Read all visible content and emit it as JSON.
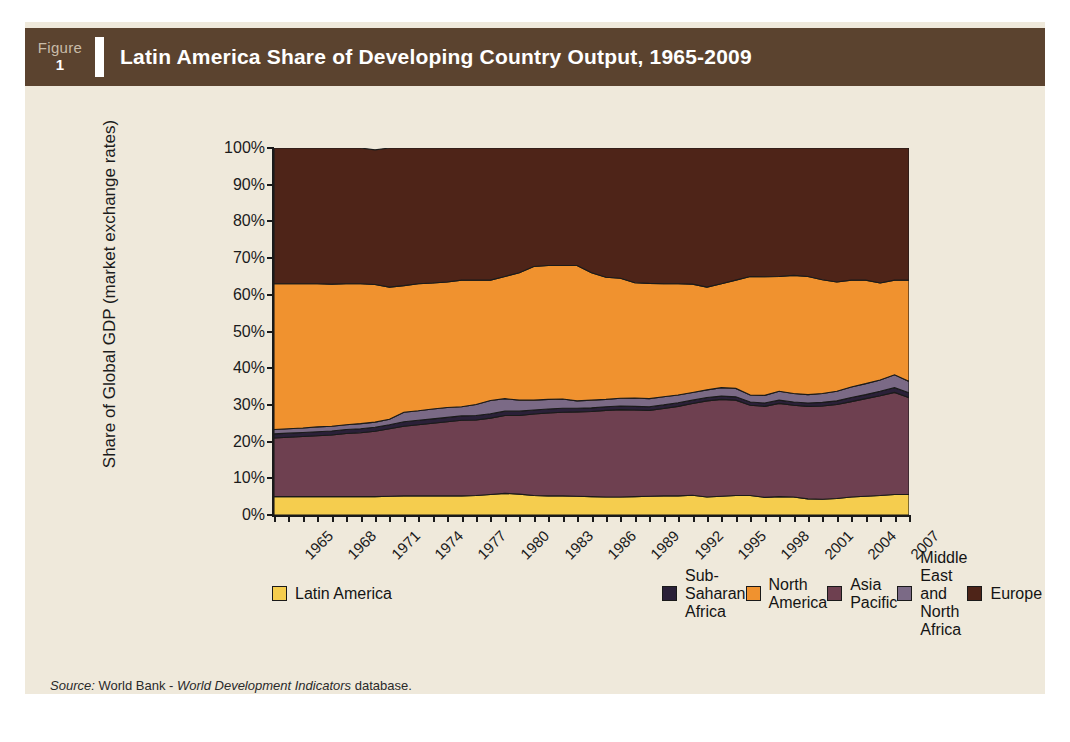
{
  "figure": {
    "word": "Figure",
    "number": "1"
  },
  "header": {
    "title": "Latin America Share of Developing Country Output, 1965-2009"
  },
  "source": {
    "prefix": "Source:",
    "body": "World Bank - ",
    "italic": "World Development Indicators",
    "suffix": " database."
  },
  "colors": {
    "page_background": "#efe9db",
    "title_bar": "#5b432f",
    "axis": "#1a1a1a",
    "latin_america": "#f5cd4e",
    "asia_pacific": "#6e4050",
    "sub_saharan_africa": "#2a2038",
    "middle_east_north_africa": "#7b6a86",
    "north_america": "#f0922f",
    "europe": "#4e2418"
  },
  "chart_data": {
    "type": "area",
    "stacked": true,
    "title": "Latin America Share of Developing Country Output, 1965-2009",
    "xlabel": "",
    "ylabel": "Share of Global GDP (market exchange rates)",
    "ylim": [
      0,
      100
    ],
    "yticks": [
      "0%",
      "10%",
      "20%",
      "30%",
      "40%",
      "50%",
      "60%",
      "70%",
      "80%",
      "90%",
      "100%"
    ],
    "ytick_values": [
      0,
      10,
      20,
      30,
      40,
      50,
      60,
      70,
      80,
      90,
      100
    ],
    "xlim": [
      1965,
      2009
    ],
    "xtick_labels": [
      "1965",
      "1968",
      "1971",
      "1974",
      "1977",
      "1980",
      "1983",
      "1986",
      "1989",
      "1992",
      "1995",
      "1998",
      "2001",
      "2004",
      "2007"
    ],
    "xtick_values": [
      1965,
      1968,
      1971,
      1974,
      1977,
      1980,
      1983,
      1986,
      1989,
      1992,
      1995,
      1998,
      2001,
      2004,
      2007
    ],
    "grid": false,
    "legend_position": "bottom",
    "x": [
      1965,
      1966,
      1967,
      1968,
      1969,
      1970,
      1971,
      1972,
      1973,
      1974,
      1975,
      1976,
      1977,
      1978,
      1979,
      1980,
      1981,
      1982,
      1983,
      1984,
      1985,
      1986,
      1987,
      1988,
      1989,
      1990,
      1991,
      1992,
      1993,
      1994,
      1995,
      1996,
      1997,
      1998,
      1999,
      2000,
      2001,
      2002,
      2003,
      2004,
      2005,
      2006,
      2007,
      2008,
      2009
    ],
    "series": [
      {
        "name": "Latin America",
        "color": "#f5cd4e",
        "values": [
          5.0,
          5.0,
          5.0,
          5.0,
          5.0,
          5.0,
          5.0,
          5.0,
          5.1,
          5.2,
          5.2,
          5.2,
          5.2,
          5.2,
          5.3,
          5.6,
          5.9,
          5.7,
          5.3,
          5.2,
          5.2,
          5.1,
          5.0,
          4.9,
          4.9,
          5.0,
          5.1,
          5.2,
          5.2,
          5.4,
          4.9,
          5.1,
          5.3,
          5.3,
          4.8,
          5.0,
          4.9,
          4.4,
          4.3,
          4.5,
          4.9,
          5.1,
          5.3,
          5.6,
          5.6
        ]
      },
      {
        "name": "Asia Pacific",
        "color": "#6e4050",
        "values": [
          16.0,
          16.2,
          16.4,
          16.6,
          16.8,
          17.2,
          17.4,
          17.8,
          18.4,
          19.0,
          19.4,
          19.8,
          20.2,
          20.6,
          20.6,
          20.8,
          21.2,
          21.4,
          22.2,
          22.6,
          22.8,
          23.0,
          23.2,
          23.6,
          23.8,
          23.6,
          23.4,
          23.8,
          24.4,
          25.0,
          26.2,
          26.4,
          26.0,
          24.6,
          24.8,
          25.4,
          25.0,
          25.2,
          25.4,
          25.6,
          26.0,
          26.6,
          27.2,
          27.8,
          26.4
        ]
      },
      {
        "name": "Sub-Saharan Africa",
        "color": "#2a2038",
        "values": [
          1.1,
          1.1,
          1.1,
          1.1,
          1.1,
          1.1,
          1.1,
          1.1,
          1.1,
          1.2,
          1.2,
          1.2,
          1.2,
          1.2,
          1.2,
          1.2,
          1.2,
          1.2,
          1.1,
          1.1,
          1.1,
          1.0,
          1.0,
          1.0,
          1.0,
          1.0,
          1.0,
          1.0,
          1.0,
          0.9,
          0.9,
          0.9,
          0.9,
          0.9,
          0.9,
          0.9,
          0.9,
          0.9,
          1.0,
          1.0,
          1.1,
          1.1,
          1.2,
          1.3,
          1.3
        ]
      },
      {
        "name": "Middle East and North Africa",
        "color": "#7b6a86",
        "values": [
          1.2,
          1.2,
          1.2,
          1.3,
          1.3,
          1.3,
          1.4,
          1.4,
          1.5,
          2.6,
          2.6,
          2.7,
          2.7,
          2.5,
          3.0,
          3.6,
          3.4,
          3.0,
          2.7,
          2.6,
          2.5,
          2.0,
          2.1,
          2.0,
          2.1,
          2.3,
          2.2,
          2.2,
          2.1,
          2.1,
          2.1,
          2.3,
          2.3,
          1.9,
          2.1,
          2.4,
          2.3,
          2.3,
          2.4,
          2.6,
          2.9,
          3.0,
          3.1,
          3.5,
          3.1
        ]
      },
      {
        "name": "North America",
        "color": "#f0922f",
        "values": [
          39.7,
          39.5,
          39.3,
          39.0,
          38.7,
          38.4,
          38.1,
          37.5,
          36.0,
          34.5,
          34.6,
          34.3,
          34.2,
          34.5,
          33.9,
          32.8,
          33.3,
          34.7,
          36.4,
          36.5,
          36.4,
          36.9,
          34.7,
          33.3,
          32.7,
          31.4,
          31.4,
          30.8,
          30.3,
          29.5,
          28.0,
          28.3,
          29.5,
          32.3,
          32.3,
          31.3,
          32.2,
          32.2,
          31.0,
          29.8,
          29.1,
          28.2,
          26.4,
          25.8,
          27.6
        ]
      },
      {
        "name": "Europe",
        "color": "#4e2418",
        "values": [
          37.0,
          37.0,
          37.0,
          37.0,
          37.1,
          37.0,
          37.0,
          36.7,
          37.9,
          37.5,
          37.0,
          36.8,
          36.5,
          36.0,
          36.0,
          36.0,
          35.0,
          34.0,
          32.3,
          32.0,
          32.0,
          32.0,
          34.0,
          35.2,
          35.5,
          36.7,
          36.9,
          37.0,
          37.0,
          37.1,
          37.9,
          37.0,
          36.0,
          35.0,
          35.1,
          35.0,
          34.7,
          35.0,
          35.9,
          36.5,
          36.0,
          36.0,
          36.8,
          36.0,
          36.0
        ]
      }
    ]
  },
  "legend": {
    "left_column": [
      {
        "label": "Latin America",
        "color": "#f5cd4e"
      },
      {
        "label": "Sub-Saharan Africa",
        "color": "#2a2038"
      },
      {
        "label": "North America",
        "color": "#f0922f"
      }
    ],
    "right_column": [
      {
        "label": "Asia Pacific",
        "color": "#6e4050"
      },
      {
        "label": "Middle East and North Africa",
        "color": "#7b6a86"
      },
      {
        "label": "Europe",
        "color": "#4e2418"
      }
    ]
  }
}
